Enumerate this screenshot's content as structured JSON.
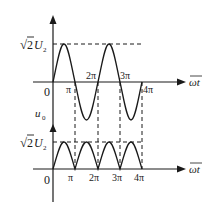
{
  "diagram": {
    "title": "",
    "top_graph": {
      "y_label_peak": "√2U₂",
      "peak_sqrt": "√",
      "peak_num": "2",
      "peak_var": "U",
      "peak_sub": "2",
      "origin": "0",
      "x_axis_label": "ωt",
      "ticks": [
        "π",
        "2π",
        "3π",
        "4π"
      ]
    },
    "bottom_graph": {
      "y_axis_label": "u",
      "y_axis_sub": "0",
      "peak_sqrt": "√",
      "peak_num": "2",
      "peak_var": "U",
      "peak_sub": "2",
      "origin": "0",
      "x_axis_label": "ωt",
      "ticks": [
        "π",
        "2π",
        "3π",
        "4π"
      ]
    },
    "colors": {
      "line": "#1a1a1a",
      "background": "#ffffff"
    }
  }
}
